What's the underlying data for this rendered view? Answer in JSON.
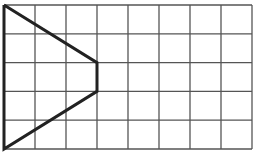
{
  "diagram": {
    "type": "grid-figure",
    "grid": {
      "columns": 8,
      "rows": 5,
      "line_color": "#555555",
      "background": "#ffffff"
    },
    "figure": {
      "description": "Closed shape traced on grid: left edge, diagonal to (3,2), vertical segment to (3,3), diagonal back to bottom-left",
      "points_grid_units": [
        [
          0,
          0
        ],
        [
          3,
          2
        ],
        [
          3,
          3
        ],
        [
          0,
          5
        ]
      ],
      "stroke_color": "#222222"
    }
  }
}
